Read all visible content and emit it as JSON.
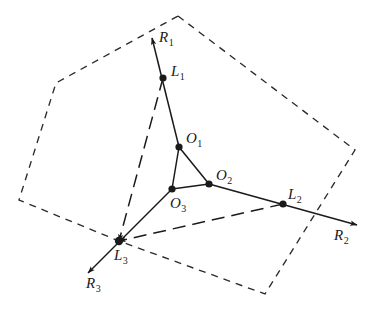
{
  "figure": {
    "colors": {
      "stroke": "#1a1a1a",
      "background": "#ffffff",
      "dash_boundary": "#2b2b2b"
    },
    "boundary": {
      "name": "dashed-hexagon",
      "style": "short-dashed",
      "vertices": [
        {
          "x": 178,
          "y": 16
        },
        {
          "x": 355,
          "y": 150
        },
        {
          "x": 265,
          "y": 294
        },
        {
          "x": 119,
          "y": 241
        },
        {
          "x": 19,
          "y": 200
        },
        {
          "x": 56,
          "y": 83
        }
      ]
    },
    "triangle": {
      "name": "central-triangle",
      "style": "solid",
      "vertices": [
        {
          "x": 179,
          "y": 147
        },
        {
          "x": 209,
          "y": 184
        },
        {
          "x": 172,
          "y": 189
        }
      ]
    },
    "points": [
      {
        "id": "O1",
        "letter": "O",
        "sub": "1",
        "x": 179,
        "y": 147,
        "label_x": 186,
        "label_y": 131
      },
      {
        "id": "O2",
        "letter": "O",
        "sub": "2",
        "x": 209,
        "y": 184,
        "label_x": 216,
        "label_y": 168
      },
      {
        "id": "O3",
        "letter": "O",
        "sub": "3",
        "x": 172,
        "y": 189,
        "label_x": 170,
        "label_y": 196
      },
      {
        "id": "L1",
        "letter": "L",
        "sub": "1",
        "x": 163,
        "y": 78,
        "label_x": 171,
        "label_y": 64
      },
      {
        "id": "L2",
        "letter": "L",
        "sub": "2",
        "x": 283,
        "y": 204,
        "label_x": 288,
        "label_y": 187
      },
      {
        "id": "L3",
        "letter": "L",
        "sub": "3",
        "x": 119,
        "y": 241,
        "label_x": 114,
        "label_y": 248
      }
    ],
    "rays": [
      {
        "name": "ray-O1-L1-R1",
        "from": {
          "x": 179,
          "y": 147
        },
        "through": {
          "x": 163,
          "y": 78
        },
        "tip": {
          "x": 152,
          "y": 38
        },
        "arrow": "tip"
      },
      {
        "name": "ray-O2-L2-R2",
        "from": {
          "x": 209,
          "y": 184
        },
        "through": {
          "x": 283,
          "y": 204
        },
        "tip": {
          "x": 357,
          "y": 225
        },
        "arrow": "tip"
      },
      {
        "name": "ray-O3-L3-R3",
        "from": {
          "x": 172,
          "y": 189
        },
        "through": {
          "x": 119,
          "y": 241
        },
        "tip": {
          "x": 88,
          "y": 273
        },
        "arrow": "tip"
      }
    ],
    "ray_endpoint_labels": [
      {
        "id": "R1",
        "letter": "R",
        "sub": "1",
        "label_x": 159,
        "label_y": 30
      },
      {
        "id": "R2",
        "letter": "R",
        "sub": "2",
        "label_x": 334,
        "label_y": 228
      },
      {
        "id": "R3",
        "letter": "R",
        "sub": "3",
        "label_x": 86,
        "label_y": 276
      }
    ],
    "long_dashed_lines": [
      {
        "name": "long-dash-L1-to-L3",
        "from": {
          "x": 163,
          "y": 78
        },
        "to": {
          "x": 119,
          "y": 241
        },
        "arrow": "end"
      },
      {
        "name": "long-dash-L2-to-L3",
        "from": {
          "x": 283,
          "y": 204
        },
        "to": {
          "x": 119,
          "y": 241
        },
        "arrow": "end"
      }
    ]
  }
}
